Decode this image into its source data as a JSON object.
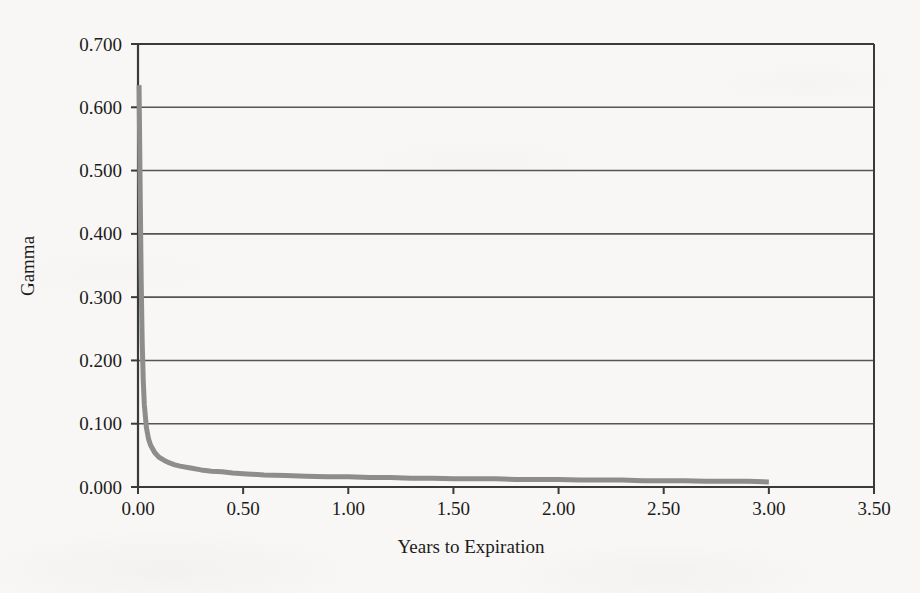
{
  "figure": {
    "background_color": "#f8f7f5",
    "plot_area": {
      "left": 138,
      "top": 44,
      "right": 874,
      "bottom": 487
    }
  },
  "colors": {
    "axis": "#3a3a3a",
    "gridline": "#555555",
    "series": "#8d8d8d",
    "text": "#1c1c1c"
  },
  "chart_data": {
    "type": "line",
    "title": "",
    "subtitle": "",
    "xlabel": "Years to Expiration",
    "ylabel": "Gamma",
    "xlim": [
      0.0,
      3.5
    ],
    "ylim": [
      0.0,
      0.7
    ],
    "grid": "horizontal",
    "legend": "none",
    "x_ticks": [
      0.0,
      0.5,
      1.0,
      1.5,
      2.0,
      2.5,
      3.0,
      3.5
    ],
    "x_tick_labels": [
      "0.00",
      "0.50",
      "1.00",
      "1.50",
      "2.00",
      "2.50",
      "3.00",
      "3.50"
    ],
    "y_ticks": [
      0.0,
      0.1,
      0.2,
      0.3,
      0.4,
      0.5,
      0.6,
      0.7
    ],
    "y_tick_labels": [
      "0.000",
      "0.100",
      "0.200",
      "0.300",
      "0.400",
      "0.500",
      "0.600",
      "0.700"
    ],
    "series": [
      {
        "name": "Gamma",
        "color": "#8d8d8d",
        "line_width": 5,
        "x": [
          0.005,
          0.01,
          0.015,
          0.02,
          0.025,
          0.03,
          0.04,
          0.05,
          0.06,
          0.08,
          0.1,
          0.125,
          0.15,
          0.175,
          0.2,
          0.25,
          0.3,
          0.35,
          0.4,
          0.45,
          0.5,
          0.6,
          0.7,
          0.8,
          0.9,
          1.0,
          1.1,
          1.2,
          1.3,
          1.4,
          1.5,
          1.6,
          1.7,
          1.8,
          1.9,
          2.0,
          2.1,
          2.2,
          2.3,
          2.4,
          2.5,
          2.6,
          2.7,
          2.8,
          2.9,
          3.0
        ],
        "y": [
          0.635,
          0.48,
          0.33,
          0.228,
          0.168,
          0.13,
          0.094,
          0.076,
          0.066,
          0.054,
          0.047,
          0.042,
          0.038,
          0.035,
          0.033,
          0.03,
          0.027,
          0.025,
          0.024,
          0.022,
          0.021,
          0.019,
          0.018,
          0.017,
          0.016,
          0.016,
          0.015,
          0.015,
          0.014,
          0.014,
          0.013,
          0.013,
          0.013,
          0.012,
          0.012,
          0.012,
          0.011,
          0.011,
          0.011,
          0.01,
          0.01,
          0.01,
          0.009,
          0.009,
          0.009,
          0.008
        ]
      }
    ]
  }
}
